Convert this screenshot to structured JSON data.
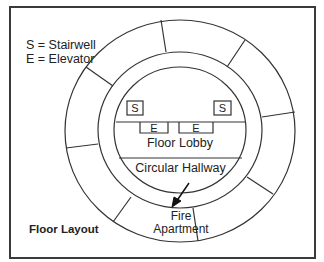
{
  "diagram": {
    "title": "Floor Layout",
    "legend": [
      {
        "key": "S",
        "text": "S = Stairwell"
      },
      {
        "key": "E",
        "text": "E = Elevator"
      }
    ],
    "labels": {
      "stair_left": "S",
      "stair_right": "S",
      "elevator_left": "E",
      "elevator_right": "E",
      "lobby": "Floor Lobby",
      "hallway": "Circular Hallway",
      "fire_apartment_line1": "Fire",
      "fire_apartment_line2": "Apartment"
    },
    "colors": {
      "stroke": "#333333",
      "background": "#ffffff",
      "frame": "#3a3a3a"
    }
  }
}
